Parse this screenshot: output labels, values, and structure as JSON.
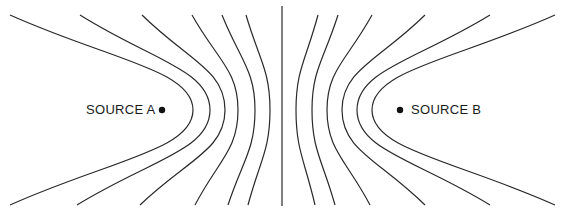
{
  "diagram": {
    "sources": [
      {
        "id": "A",
        "label": "SOURCE A"
      },
      {
        "id": "B",
        "label": "SOURCE B"
      }
    ],
    "line_color": "#2a2a2a",
    "dot_color": "#111111",
    "curves_per_side": 6,
    "has_center_line": true
  }
}
